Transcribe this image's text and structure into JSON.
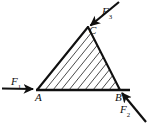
{
  "figure": {
    "kind": "force-diagram",
    "background_color": "#ffffff",
    "stroke_color": "#101010",
    "hatch_color": "#2b2b2b",
    "width": 149,
    "height": 124,
    "triangle": {
      "name": "triangle-ABC",
      "vertices": [
        {
          "id": "A",
          "label": "A",
          "x": 37,
          "y": 90
        },
        {
          "id": "B",
          "label": "B",
          "x": 120,
          "y": 90
        },
        {
          "id": "C",
          "label": "C",
          "x": 88,
          "y": 27
        }
      ],
      "hatched": true,
      "hatch_direction": "parallel-to-AC",
      "hatch_count": 11
    },
    "forces": [
      {
        "id": "F1",
        "label": "F",
        "subscript": "1",
        "applied_at": "A",
        "direction": "right",
        "tail": {
          "x": 2,
          "y": 88
        },
        "head": {
          "x": 36,
          "y": 89
        }
      },
      {
        "id": "F3",
        "label": "F",
        "subscript": "3",
        "applied_at": "C",
        "direction": "down-left",
        "tail": {
          "x": 119,
          "y": 2
        },
        "head": {
          "x": 87,
          "y": 28
        }
      },
      {
        "id": "F2",
        "label": "F",
        "subscript": "2",
        "applied_at": "B",
        "direction": "up-left",
        "tail": {
          "x": 146,
          "y": 122
        },
        "head": {
          "x": 119,
          "y": 90
        }
      }
    ],
    "baseline": {
      "name": "baseline-AB-extended",
      "from": {
        "x": 36,
        "y": 90
      },
      "to": {
        "x": 130,
        "y": 90
      }
    }
  }
}
